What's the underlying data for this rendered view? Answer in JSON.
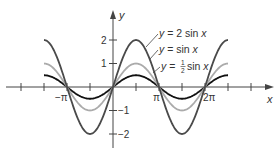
{
  "chart_data": {
    "type": "line",
    "title": "",
    "xlabel": "x",
    "ylabel": "y",
    "xlim": [
      -4.71,
      8.8
    ],
    "ylim": [
      -2.6,
      3.2
    ],
    "grid": false,
    "x_ticks": [
      "-π",
      "π",
      "2π"
    ],
    "x_tick_step": "π/2",
    "y_ticks": [
      "2",
      "1",
      "-1",
      "-2"
    ],
    "domain": [
      "-3π/2",
      "5π/2"
    ],
    "series": [
      {
        "name": "y = 2 sin x",
        "formula": "2*sin(x)",
        "amplitude": 2,
        "color": "#4a4a4a"
      },
      {
        "name": "y = sin x",
        "formula": "sin(x)",
        "amplitude": 1,
        "color": "#ababab"
      },
      {
        "name": "y = ½ sin x",
        "formula": "0.5*sin(x)",
        "amplitude": 0.5,
        "color": "#111111"
      }
    ],
    "annotations": [
      {
        "text": "y = 2 sin x"
      },
      {
        "text": "y = sin x"
      },
      {
        "text": "y = ½ sin x"
      }
    ]
  },
  "labels": {
    "x_axis": "x",
    "y_axis": "y",
    "tick_neg_pi": "−π",
    "tick_pi": "π",
    "tick_2pi": "2π",
    "tick_y2": "2",
    "tick_y1": "1",
    "tick_ym1": "−1",
    "tick_ym2": "−2",
    "legend_2sin_pre": "y",
    "legend_2sin_post": " = 2 sin ",
    "legend_2sin_x": "x",
    "legend_sin_pre": "y",
    "legend_sin_post": " = sin ",
    "legend_sin_x": "x",
    "legend_half_pre": "y",
    "legend_half_eq": " = ",
    "legend_half_num": "1",
    "legend_half_den": "2",
    "legend_half_post": " sin ",
    "legend_half_x": "x"
  }
}
